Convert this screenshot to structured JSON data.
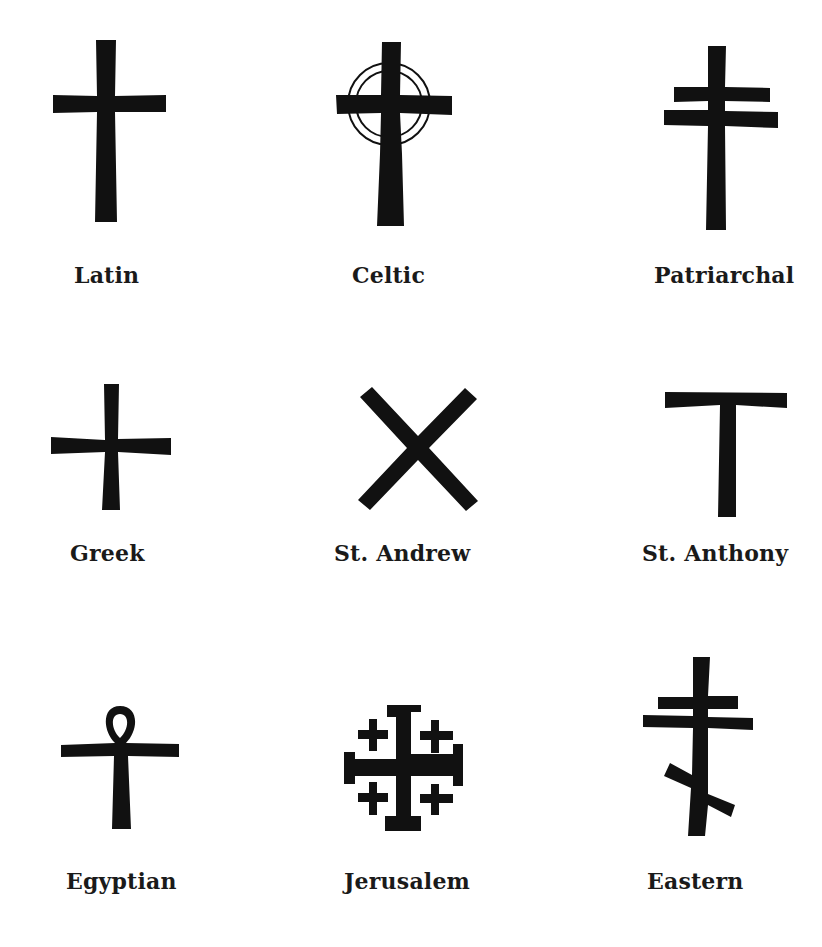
{
  "figure": {
    "ink_color": "#111111",
    "background": "#ffffff",
    "crosses": [
      {
        "name": "Latin",
        "row": 1,
        "col": 1
      },
      {
        "name": "Celtic",
        "row": 1,
        "col": 2
      },
      {
        "name": "Patriarchal",
        "row": 1,
        "col": 3
      },
      {
        "name": "Greek",
        "row": 2,
        "col": 1
      },
      {
        "name": "St. Andrew",
        "row": 2,
        "col": 2
      },
      {
        "name": "St. Anthony",
        "row": 2,
        "col": 3
      },
      {
        "name": "Egyptian",
        "row": 3,
        "col": 1
      },
      {
        "name": "Jerusalem",
        "row": 3,
        "col": 2
      },
      {
        "name": "Eastern",
        "row": 3,
        "col": 3
      }
    ]
  }
}
